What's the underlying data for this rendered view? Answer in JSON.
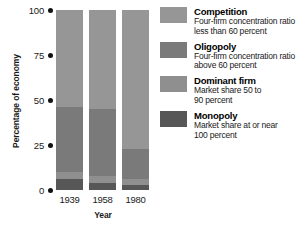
{
  "chart_data": {
    "type": "bar",
    "subtype": "stacked-100-percent",
    "title": "",
    "xlabel": "Year",
    "ylabel": "Percentage of economy",
    "categories": [
      "1939",
      "1958",
      "1980"
    ],
    "ylim": [
      0,
      100
    ],
    "yticks": [
      0,
      25,
      50,
      75,
      100
    ],
    "ytick_labels": [
      "0",
      "25",
      "50",
      "75",
      "100"
    ],
    "grid": false,
    "legend_position": "right",
    "series": [
      {
        "name": "Competition",
        "values": [
          54,
          55,
          77
        ],
        "color": "#969696"
      },
      {
        "name": "Oligopoly",
        "values": [
          36,
          37,
          17
        ],
        "color": "#7a7a7a"
      },
      {
        "name": "Dominant firm",
        "values": [
          4,
          4,
          3
        ],
        "color": "#8f8f8f"
      },
      {
        "name": "Monopoly",
        "values": [
          6,
          4,
          3
        ],
        "color": "#575757"
      }
    ],
    "stack_order_bottom_to_top": [
      "Monopoly",
      "Dominant firm",
      "Oligopoly",
      "Competition"
    ]
  },
  "axis": {
    "ylabel": "Percentage of economy",
    "xlabel": "Year",
    "ytick_0": "0",
    "ytick_1": "25",
    "ytick_2": "50",
    "ytick_3": "75",
    "ytick_4": "100",
    "xtick_0": "1939",
    "xtick_1": "1958",
    "xtick_2": "1980"
  },
  "legend": {
    "items": [
      {
        "label": "Competition",
        "desc_line1": "Four-firm concentration ratio",
        "desc_line2": "less than 60 percent",
        "color": "#969696"
      },
      {
        "label": "Oligopoly",
        "desc_line1": "Four-firm concentration ratio",
        "desc_line2": "above 60 percent",
        "color": "#7a7a7a"
      },
      {
        "label": "Dominant firm",
        "desc_line1": "Market share 50 to",
        "desc_line2": "90 percent",
        "color": "#8f8f8f"
      },
      {
        "label": "Monopoly",
        "desc_line1": "Market share at or near",
        "desc_line2": "100 percent",
        "color": "#575757"
      }
    ]
  }
}
